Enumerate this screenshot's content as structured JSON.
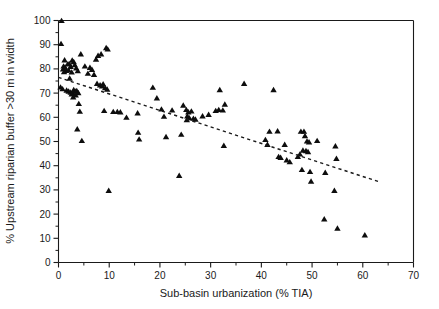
{
  "chart_data": {
    "type": "scatter",
    "title": "",
    "xlabel": "Sub-basin urbanization (% TIA)",
    "ylabel": "% Upstream riparian buffer >30 m in width",
    "xlim": [
      0,
      70
    ],
    "ylim": [
      0,
      100
    ],
    "xticks": [
      0,
      10,
      20,
      30,
      40,
      50,
      60,
      70
    ],
    "xticklabels": [
      "0",
      "10",
      "20",
      "30",
      "40",
      "50",
      "60",
      "70"
    ],
    "xminorticks": [
      5,
      15,
      25,
      35,
      45,
      55,
      65
    ],
    "yticks": [
      0,
      10,
      20,
      30,
      40,
      50,
      60,
      70,
      80,
      90,
      100
    ],
    "yticklabels": [
      "0",
      "10",
      "20",
      "30",
      "40",
      "50",
      "60",
      "70",
      "80",
      "90",
      "100"
    ],
    "yminorticks": [
      5,
      15,
      25,
      35,
      45,
      55,
      65,
      75,
      85,
      95
    ],
    "grid": false,
    "legend": null,
    "marker_shape": "triangle-up",
    "marker_color": "#0d0d0d",
    "series": [
      {
        "name": "Sub-basins",
        "points": [
          [
            0.6,
            99.8
          ],
          [
            0.5,
            90.3
          ],
          [
            1.2,
            83.5
          ],
          [
            1.0,
            81.0
          ],
          [
            1.3,
            80.5
          ],
          [
            0.9,
            79.8
          ],
          [
            1.5,
            79.2
          ],
          [
            1.1,
            78.6
          ],
          [
            1.8,
            81.8
          ],
          [
            2.1,
            82.0
          ],
          [
            2.4,
            80.8
          ],
          [
            2.0,
            79.4
          ],
          [
            2.6,
            78.5
          ],
          [
            2.2,
            76.0
          ],
          [
            0.4,
            72.3
          ],
          [
            0.8,
            71.6
          ],
          [
            1.6,
            71.0
          ],
          [
            2.0,
            70.6
          ],
          [
            2.4,
            70.2
          ],
          [
            2.8,
            70.0
          ],
          [
            3.0,
            71.2
          ],
          [
            3.3,
            70.6
          ],
          [
            2.6,
            69.4
          ],
          [
            3.6,
            70.8
          ],
          [
            3.9,
            70.0
          ],
          [
            3.4,
            69.0
          ],
          [
            2.9,
            68.2
          ],
          [
            3.2,
            81.5
          ],
          [
            3.0,
            82.8
          ],
          [
            2.7,
            83.4
          ],
          [
            3.5,
            80.2
          ],
          [
            3.8,
            79.0
          ],
          [
            4.4,
            86.0
          ],
          [
            4.0,
            65.5
          ],
          [
            4.2,
            62.3
          ],
          [
            3.7,
            55.0
          ],
          [
            4.6,
            50.2
          ],
          [
            5.2,
            81.0
          ],
          [
            5.8,
            78.0
          ],
          [
            6.2,
            80.4
          ],
          [
            6.6,
            79.6
          ],
          [
            7.0,
            77.5
          ],
          [
            7.4,
            83.8
          ],
          [
            7.8,
            85.4
          ],
          [
            8.4,
            86.0
          ],
          [
            9.4,
            88.6
          ],
          [
            9.7,
            88.0
          ],
          [
            8.8,
            73.6
          ],
          [
            8.2,
            73.2
          ],
          [
            8.6,
            72.8
          ],
          [
            9.2,
            72.0
          ],
          [
            9.6,
            71.4
          ],
          [
            7.6,
            73.8
          ],
          [
            9.0,
            62.6
          ],
          [
            9.9,
            29.6
          ],
          [
            10.8,
            62.2
          ],
          [
            11.6,
            62.2
          ],
          [
            12.2,
            62.0
          ],
          [
            13.4,
            59.8
          ],
          [
            15.6,
            61.6
          ],
          [
            15.7,
            53.6
          ],
          [
            15.9,
            50.8
          ],
          [
            18.6,
            72.2
          ],
          [
            19.4,
            67.8
          ],
          [
            20.3,
            63.2
          ],
          [
            20.8,
            60.2
          ],
          [
            21.2,
            51.8
          ],
          [
            22.4,
            62.8
          ],
          [
            23.8,
            35.8
          ],
          [
            24.6,
            64.8
          ],
          [
            24.2,
            52.8
          ],
          [
            25.2,
            63.0
          ],
          [
            25.6,
            62.0
          ],
          [
            25.4,
            60.4
          ],
          [
            25.8,
            59.6
          ],
          [
            25.3,
            58.8
          ],
          [
            26.2,
            62.4
          ],
          [
            26.6,
            59.4
          ],
          [
            27.0,
            59.0
          ],
          [
            28.4,
            60.4
          ],
          [
            29.6,
            61.0
          ],
          [
            31.0,
            62.6
          ],
          [
            31.6,
            63.0
          ],
          [
            31.8,
            71.2
          ],
          [
            32.4,
            62.8
          ],
          [
            32.8,
            65.2
          ],
          [
            32.6,
            48.2
          ],
          [
            36.6,
            73.8
          ],
          [
            40.8,
            50.6
          ],
          [
            41.2,
            48.6
          ],
          [
            41.6,
            54.0
          ],
          [
            42.4,
            71.2
          ],
          [
            43.2,
            54.2
          ],
          [
            43.4,
            43.6
          ],
          [
            43.8,
            43.2
          ],
          [
            44.6,
            48.6
          ],
          [
            45.0,
            42.2
          ],
          [
            45.6,
            41.4
          ],
          [
            47.2,
            43.6
          ],
          [
            47.6,
            44.6
          ],
          [
            47.8,
            54.0
          ],
          [
            48.4,
            54.0
          ],
          [
            48.6,
            52.2
          ],
          [
            48.2,
            46.2
          ],
          [
            48.8,
            46.0
          ],
          [
            48.0,
            38.2
          ],
          [
            49.0,
            50.0
          ],
          [
            49.4,
            49.6
          ],
          [
            49.2,
            45.6
          ],
          [
            49.6,
            37.4
          ],
          [
            49.8,
            33.4
          ],
          [
            51.0,
            50.2
          ],
          [
            52.6,
            37.0
          ],
          [
            52.4,
            17.8
          ],
          [
            54.6,
            48.0
          ],
          [
            54.8,
            42.8
          ],
          [
            54.4,
            29.6
          ],
          [
            55.0,
            14.0
          ],
          [
            60.4,
            11.2
          ]
        ]
      }
    ],
    "trendline": {
      "style": "dashed",
      "x": [
        0,
        63
      ],
      "y": [
        76.5,
        33.5
      ]
    }
  }
}
